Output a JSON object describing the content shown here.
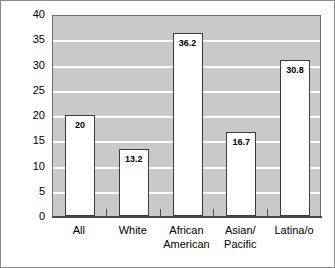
{
  "chart_data": {
    "type": "bar",
    "title": "",
    "subtitle": "",
    "xlabel": "",
    "ylabel": "",
    "categories": [
      "All",
      "White",
      "African\nAmerican",
      "Asian/\nPacific",
      "Latina/o"
    ],
    "values": [
      20,
      13.2,
      36.2,
      16.7,
      30.8
    ],
    "value_labels": [
      "20",
      "13.2",
      "36.2",
      "16.7",
      "30.8"
    ],
    "ylim": [
      0,
      40
    ],
    "yticks": [
      0,
      5,
      10,
      15,
      20,
      25,
      30,
      35,
      40
    ],
    "ytick_labels": [
      "0",
      "5",
      "10",
      "15",
      "20",
      "25",
      "30",
      "35",
      "40"
    ],
    "grid": true,
    "grid_axis": "y",
    "legend": false,
    "legend_position": "none",
    "colors": {
      "plot_background": "#c9c9c9",
      "gridline": "#ffffff",
      "bar_fill": "#ffffff",
      "bar_edge": "#3c3c3c",
      "axis": "#4a4a4a",
      "text": "#000000",
      "figure_background": "#ffffff",
      "figure_border": "#8c8c8c"
    }
  }
}
